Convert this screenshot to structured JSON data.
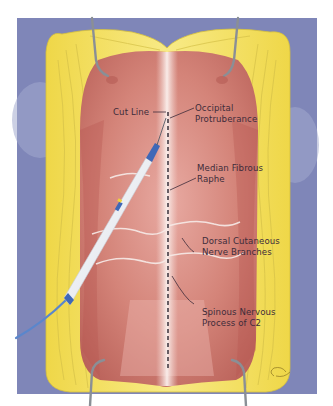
{
  "figure": {
    "colors": {
      "drape": "#7f86b8",
      "fat": "#f0dc5a",
      "muscle": "#c9716b",
      "muscle_light": "#e6a69f",
      "raphe": "#f3e4e0",
      "retractor": "#8a8f96",
      "pen_body": "#f4f6fa",
      "pen_accent": "#3f68b7",
      "cable": "#5a86cc",
      "label_text": "#3d2c3a"
    }
  },
  "labels": [
    {
      "id": "cut-line",
      "lines": [
        "Cut Line"
      ]
    },
    {
      "id": "occipital-protuberance",
      "lines": [
        "Occipital",
        "Protruberance"
      ]
    },
    {
      "id": "median-fibrous-raphe",
      "lines": [
        "Median Fibrous",
        "Raphe"
      ]
    },
    {
      "id": "dorsal-cutaneous-nerve-branches",
      "lines": [
        "Dorsal Cutaneous",
        "Nerve Branches"
      ]
    },
    {
      "id": "spinous-process-c2",
      "lines": [
        "Spinous Nervous",
        "Process of C2"
      ]
    }
  ],
  "instruments": [
    {
      "id": "electrocautery-pen",
      "type": "monopolar cautery pen"
    },
    {
      "id": "retractor-top-left",
      "type": "retractor blade"
    },
    {
      "id": "retractor-top-right",
      "type": "retractor blade"
    },
    {
      "id": "retractor-bottom-left",
      "type": "retractor blade"
    },
    {
      "id": "retractor-bottom-right",
      "type": "retractor blade"
    }
  ]
}
